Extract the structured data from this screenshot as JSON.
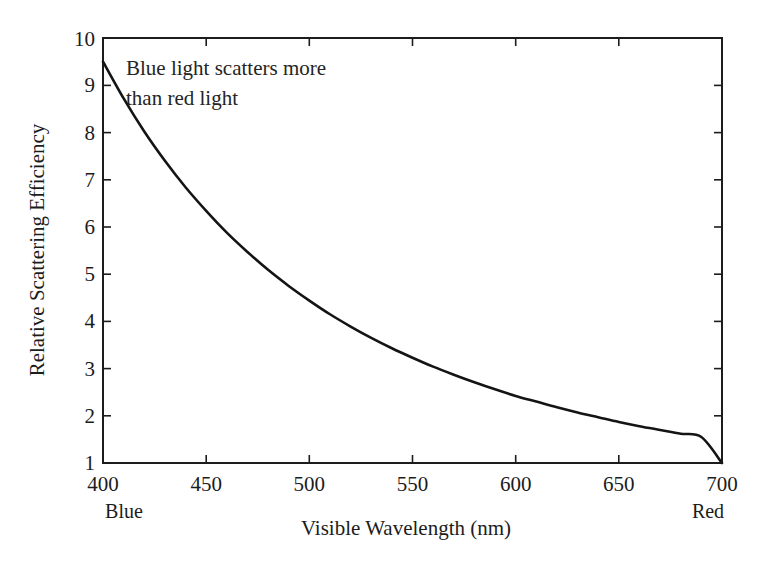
{
  "figure": {
    "background_color": "#ffffff",
    "foreground_color": "#1c1c1c"
  },
  "chart_data": {
    "type": "line",
    "title": "",
    "subtitle": "",
    "xlabel": "Visible Wavelength (nm)",
    "ylabel": "Relative Scattering Efficiency",
    "xlim": [
      400,
      700
    ],
    "ylim": [
      1,
      10
    ],
    "xticks": [
      400,
      450,
      500,
      550,
      600,
      650,
      700
    ],
    "xticklabels": [
      "400",
      "450",
      "500",
      "550",
      "600",
      "650",
      "700"
    ],
    "yticks": [
      1,
      2,
      3,
      4,
      5,
      6,
      7,
      8,
      9,
      10
    ],
    "yticklabels": [
      "1",
      "2",
      "3",
      "4",
      "5",
      "6",
      "7",
      "8",
      "9",
      "10"
    ],
    "grid": false,
    "legend": null,
    "legend_position": "none",
    "series": [
      {
        "name": "Rayleigh scattering efficiency",
        "color": "#141414",
        "x": [
          400,
          410,
          420,
          430,
          440,
          450,
          460,
          470,
          480,
          490,
          500,
          510,
          520,
          530,
          540,
          550,
          560,
          570,
          580,
          590,
          600,
          610,
          620,
          630,
          640,
          650,
          660,
          670,
          680,
          690,
          700
        ],
        "values": [
          9.5,
          8.72,
          8.02,
          7.4,
          6.84,
          6.34,
          5.88,
          5.47,
          5.09,
          4.75,
          4.44,
          4.15,
          3.89,
          3.65,
          3.43,
          3.23,
          3.04,
          2.87,
          2.71,
          2.56,
          2.42,
          2.3,
          2.18,
          2.07,
          1.97,
          1.87,
          1.78,
          1.7,
          1.62,
          1.55,
          1.0
        ]
      }
    ],
    "axis_end_labels": {
      "x_min": "Blue",
      "x_max": "Red"
    },
    "annotations": [
      {
        "name": "curve-annotation",
        "lines": [
          "Blue light scatters more",
          "than red light"
        ],
        "x": 415,
        "y": 9.3
      }
    ]
  }
}
